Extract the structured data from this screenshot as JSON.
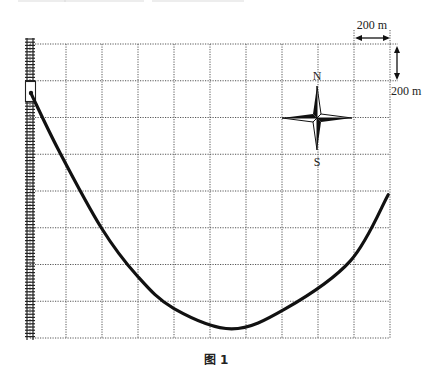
{
  "figure": {
    "caption": "图 1",
    "scale": {
      "horizontal_label": "200 m",
      "vertical_label": "200 m",
      "cell_size_m": 200
    },
    "compass": {
      "north_label": "N",
      "south_label": "S"
    },
    "grid": {
      "columns": 10,
      "rows": 8,
      "style": "dotted"
    },
    "railway": {
      "icon": "railway-track-icon",
      "side": "left"
    },
    "station": {
      "icon": "station-box-icon"
    },
    "route": {
      "description": "curved path from station on railway, descending to a minimum near the bottom, rising to the right edge",
      "points_grid_units": [
        [
          0.03,
          1.35
        ],
        [
          0.8,
          2.9
        ],
        [
          1.98,
          5.0
        ],
        [
          2.97,
          6.3
        ],
        [
          4.0,
          7.2
        ],
        [
          5.6,
          7.75
        ],
        [
          7.1,
          7.2
        ],
        [
          8.9,
          5.9
        ],
        [
          9.95,
          4.1
        ]
      ]
    },
    "colors": {
      "line": "#111111",
      "grid": "#555555",
      "background": "#ffffff"
    }
  }
}
